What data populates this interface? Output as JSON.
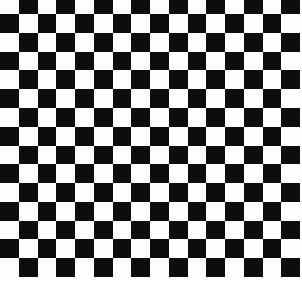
{
  "board": {
    "pattern": "checkerboard",
    "columns": 16,
    "rows": 15,
    "first_row_height_px": 14,
    "top_left_color": "light",
    "colors": {
      "dark": "#0d0d0d",
      "light": "#fdfdfd",
      "background": "#ffffff"
    }
  }
}
